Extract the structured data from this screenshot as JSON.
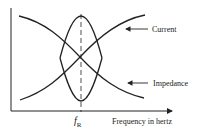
{
  "diagram": {
    "title": "",
    "x_axis_label": "Frequency in hertz",
    "resonance_label": "f",
    "resonance_subscript": "R",
    "curves": [
      {
        "name": "Current",
        "label": "Current",
        "shape": "peak at f_R"
      },
      {
        "name": "Impedance",
        "label": "Impedance",
        "shape": "minimum at f_R"
      }
    ],
    "colors": {
      "line": "#222222",
      "background": "#ffffff"
    }
  }
}
